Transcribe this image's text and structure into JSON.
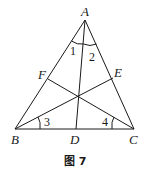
{
  "figure": {
    "caption": "图 7",
    "points": {
      "A": {
        "label": "A",
        "x": 85,
        "y": 20
      },
      "B": {
        "label": "B",
        "x": 15,
        "y": 129
      },
      "C": {
        "label": "C",
        "x": 134,
        "y": 129
      },
      "D": {
        "label": "D",
        "x": 76,
        "y": 129
      },
      "E": {
        "label": "E",
        "x": 113,
        "y": 78
      },
      "F": {
        "label": "F",
        "x": 48,
        "y": 79
      }
    },
    "angles": {
      "a1": "1",
      "a2": "2",
      "a3": "3",
      "a4": "4"
    },
    "segments": [
      "AB",
      "AC",
      "BC",
      "AD",
      "BE",
      "CF"
    ]
  }
}
